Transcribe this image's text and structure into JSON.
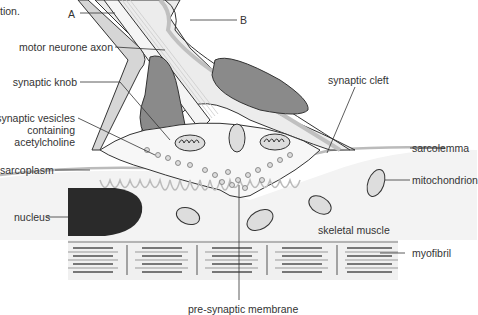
{
  "caption_fragment": "tion.",
  "labels": {
    "A": "A",
    "B": "B",
    "motor_neurone_axon": "motor neurone axon",
    "synaptic_knob": "synaptic knob",
    "synaptic_vesicles_1": "synaptic vesicles",
    "synaptic_vesicles_2": "containing",
    "synaptic_vesicles_3": "acetylcholine",
    "sarcoplasm": "sarcoplasm",
    "nucleus": "nucleus",
    "synaptic_cleft": "synaptic cleft",
    "sarcolemma": "sarcolemma",
    "mitochondrion": "mitochondrion",
    "skeletal_muscle": "skeletal muscle",
    "myofibril": "myofibril",
    "pre_synaptic_membrane": "pre-synaptic membrane"
  },
  "colors": {
    "outline": "#333333",
    "sheath": "#c8c8c8",
    "schwann_nucleus": "#8a8a8a",
    "muscle_nucleus": "#2a2a2a",
    "muscle_fill": "#f2f2f2",
    "folds": "#bdbdbd"
  }
}
